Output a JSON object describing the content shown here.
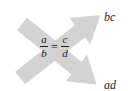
{
  "diagram": {
    "equation": {
      "left": {
        "numerator": "a",
        "denominator": "b"
      },
      "operator": "=",
      "right": {
        "numerator": "c",
        "denominator": "d"
      }
    },
    "arrows": [
      {
        "direction": "bottom-left to top-right",
        "target_label": "bc"
      },
      {
        "direction": "top-left to bottom-right",
        "target_label": "ad"
      }
    ],
    "colors": {
      "arrow": "#d3d3d3",
      "text": "#222222",
      "background": "#ffffff"
    }
  }
}
